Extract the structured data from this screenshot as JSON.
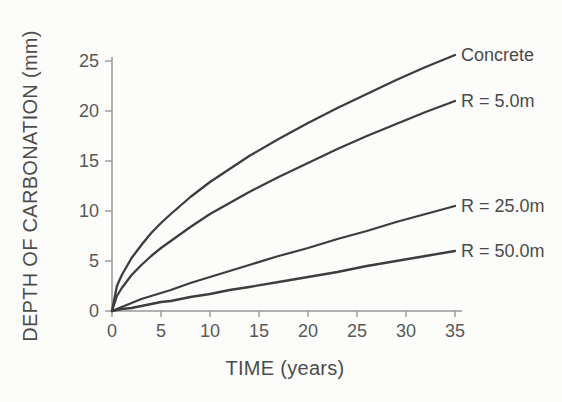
{
  "figure": {
    "colors": {
      "background": "#fcfcfb",
      "axis": "#989898",
      "curve": "#3d3d3d",
      "tick_label": "#585858",
      "axis_title": "#4c4c4c",
      "series_label": "#4a4a4a"
    }
  },
  "chart_data": {
    "type": "line",
    "title": "",
    "xlabel": "TIME (years)",
    "ylabel": "DEPTH OF CARBONATION (mm)",
    "xlim": [
      0,
      35
    ],
    "ylim": [
      0,
      25
    ],
    "xticks": [
      0,
      5,
      10,
      15,
      20,
      25,
      30,
      35
    ],
    "yticks": [
      0,
      5,
      10,
      15,
      20,
      25
    ],
    "grid": false,
    "legend_position": "curve-end-labels-right",
    "x": [
      0,
      0.5,
      1,
      2,
      3,
      4,
      5,
      6,
      8,
      10,
      12,
      14,
      17,
      20,
      23,
      26,
      29,
      32,
      35
    ],
    "series": [
      {
        "name": "Concrete",
        "values": [
          0,
          2.5,
          3.6,
          5.3,
          6.6,
          7.8,
          8.8,
          9.7,
          11.4,
          12.9,
          14.2,
          15.5,
          17.2,
          18.8,
          20.3,
          21.7,
          23.1,
          24.4,
          25.6
        ]
      },
      {
        "name": "R = 5.0m",
        "values": [
          0,
          1.5,
          2.3,
          3.6,
          4.6,
          5.5,
          6.3,
          7.0,
          8.4,
          9.7,
          10.8,
          11.9,
          13.4,
          14.8,
          16.2,
          17.5,
          18.7,
          19.9,
          21.0
        ]
      },
      {
        "name": "R = 25.0m",
        "values": [
          0,
          0.2,
          0.4,
          0.8,
          1.2,
          1.5,
          1.8,
          2.1,
          2.8,
          3.4,
          4.0,
          4.6,
          5.5,
          6.3,
          7.2,
          8.0,
          8.9,
          9.7,
          10.5
        ]
      },
      {
        "name": "R = 50.0m",
        "values": [
          0,
          0.1,
          0.2,
          0.3,
          0.5,
          0.7,
          0.9,
          1.0,
          1.4,
          1.7,
          2.1,
          2.4,
          2.9,
          3.4,
          3.9,
          4.5,
          5.0,
          5.5,
          6.0
        ]
      }
    ]
  }
}
